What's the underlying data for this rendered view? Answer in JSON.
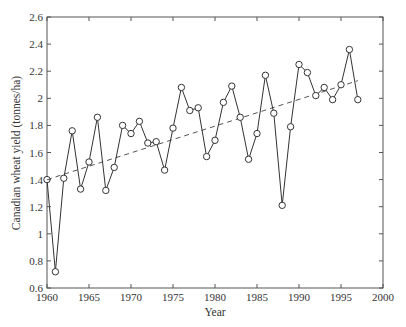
{
  "chart_data": {
    "type": "line",
    "title": "",
    "xlabel": "Year",
    "ylabel": "Canadian wheat yield (tonnes/ha)",
    "xlim": [
      1960,
      2000
    ],
    "ylim": [
      0.6,
      2.6
    ],
    "x_ticks": [
      1960,
      1965,
      1970,
      1975,
      1980,
      1985,
      1990,
      1995,
      2000
    ],
    "y_ticks": [
      0.6,
      0.8,
      1.0,
      1.2,
      1.4,
      1.6,
      1.8,
      2.0,
      2.2,
      2.4,
      2.6
    ],
    "y_tick_labels": [
      "0.6",
      "0.8",
      "1",
      "1.2",
      "1.4",
      "1.6",
      "1.8",
      "2",
      "2.2",
      "2.4",
      "2.6"
    ],
    "grid": false,
    "legend": null,
    "series": [
      {
        "name": "Yield",
        "style": "solid line with circle markers",
        "x": [
          1960,
          1961,
          1962,
          1963,
          1964,
          1965,
          1966,
          1967,
          1968,
          1969,
          1970,
          1971,
          1972,
          1973,
          1974,
          1975,
          1976,
          1977,
          1978,
          1979,
          1980,
          1981,
          1982,
          1983,
          1984,
          1985,
          1986,
          1987,
          1988,
          1989,
          1990,
          1991,
          1992,
          1993,
          1994,
          1995,
          1996,
          1997
        ],
        "values": [
          1.4,
          0.72,
          1.41,
          1.76,
          1.33,
          1.53,
          1.86,
          1.32,
          1.49,
          1.8,
          1.74,
          1.83,
          1.67,
          1.68,
          1.47,
          1.78,
          2.08,
          1.91,
          1.93,
          1.57,
          1.69,
          1.97,
          2.09,
          1.86,
          1.55,
          1.74,
          2.17,
          1.89,
          1.21,
          1.79,
          2.25,
          2.19,
          2.02,
          2.08,
          1.99,
          2.1,
          2.36,
          1.99
        ]
      },
      {
        "name": "Linear trend",
        "style": "dashed line",
        "x": [
          1960,
          1997
        ],
        "values": [
          1.4,
          2.13
        ]
      }
    ]
  },
  "plot_box": {
    "left": 47,
    "top": 17,
    "right": 383,
    "bottom": 288
  },
  "colors": {
    "line": "#333333",
    "axis": "#555555",
    "trend": "#555555"
  }
}
